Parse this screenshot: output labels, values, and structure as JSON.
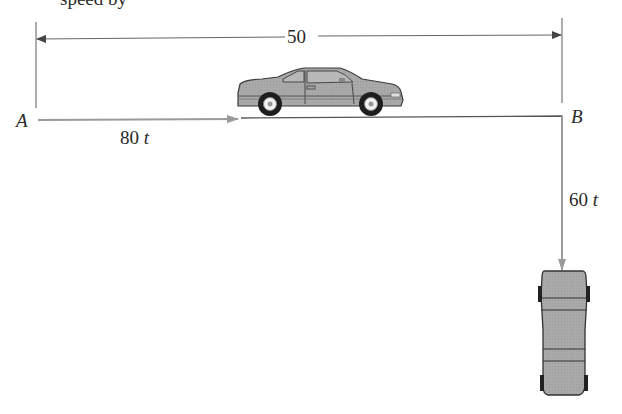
{
  "header_fragment": "speed by",
  "dimension": {
    "value": "50"
  },
  "points": {
    "start": "A",
    "end": "B"
  },
  "motion": {
    "horizontal": {
      "coefficient": "80",
      "variable": "t"
    },
    "vertical": {
      "coefficient": "60",
      "variable": "t"
    }
  },
  "colors": {
    "line": "#555555",
    "arrow_gray": "#9a9a9a",
    "car_body": "#a8a8a8",
    "car_outline": "#3a3a3a"
  }
}
